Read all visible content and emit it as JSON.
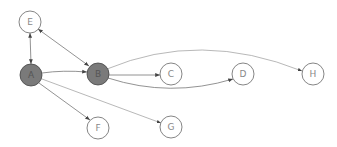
{
  "diagram": {
    "type": "directed-graph",
    "colors": {
      "edge": "#777777",
      "node_stroke": "#666666",
      "filled_node": "#7a7a7a",
      "empty_node": "#ffffff",
      "label_filled": "#444444",
      "label_empty": "#888888"
    },
    "nodes": [
      {
        "id": "E",
        "label": "E",
        "x": 30,
        "y": 22,
        "filled": false
      },
      {
        "id": "A",
        "label": "A",
        "x": 31,
        "y": 75,
        "filled": true
      },
      {
        "id": "B",
        "label": "B",
        "x": 98,
        "y": 74,
        "filled": true
      },
      {
        "id": "C",
        "label": "C",
        "x": 171,
        "y": 74,
        "filled": false
      },
      {
        "id": "D",
        "label": "D",
        "x": 243,
        "y": 74,
        "filled": false
      },
      {
        "id": "H",
        "label": "H",
        "x": 313,
        "y": 74,
        "filled": false
      },
      {
        "id": "F",
        "label": "F",
        "x": 98,
        "y": 128,
        "filled": false
      },
      {
        "id": "G",
        "label": "G",
        "x": 171,
        "y": 127,
        "filled": false
      }
    ],
    "edges": [
      {
        "from": "A",
        "to": "E",
        "bidirectional": true
      },
      {
        "from": "E",
        "to": "B",
        "bidirectional": true
      },
      {
        "from": "A",
        "to": "B",
        "bidirectional": false
      },
      {
        "from": "A",
        "to": "F",
        "bidirectional": false
      },
      {
        "from": "A",
        "to": "G",
        "bidirectional": false
      },
      {
        "from": "B",
        "to": "C",
        "bidirectional": false
      },
      {
        "from": "B",
        "to": "D",
        "bidirectional": false,
        "curved": true
      },
      {
        "from": "B",
        "to": "H",
        "bidirectional": false,
        "curved": true
      }
    ]
  }
}
